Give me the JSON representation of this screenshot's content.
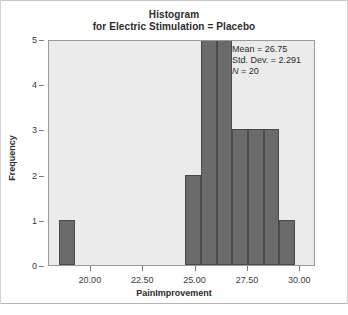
{
  "title": {
    "line1": "Histogram",
    "line2": "for Electric Stimulation = Placebo"
  },
  "stats": {
    "mean_label": "Mean = 26.75",
    "stddev_label": "Std. Dev. = 2.291",
    "n_symbol": "N",
    "n_value": " = 20"
  },
  "colors": {
    "bar_fill": "#6b6b6b",
    "bar_border": "#4a4a4a",
    "plot_background": "#ebebeb",
    "axis": "#9a9a9a",
    "text": "#2b2b2b"
  },
  "chart_data": {
    "type": "bar",
    "title": "Histogram for Electric Stimulation = Placebo",
    "xlabel": "PainImprovement",
    "ylabel": "Frequency",
    "xlim": [
      18.0,
      30.75
    ],
    "ylim": [
      0,
      5
    ],
    "grid": false,
    "legend": null,
    "bin_width": 0.75,
    "x_ticks": [
      {
        "value": 20.0,
        "label": "20.00"
      },
      {
        "value": 22.5,
        "label": "22.50"
      },
      {
        "value": 25.0,
        "label": "25.00"
      },
      {
        "value": 27.5,
        "label": "27.50"
      },
      {
        "value": 30.0,
        "label": "30.00"
      }
    ],
    "y_ticks": [
      {
        "value": 0,
        "label": "0"
      },
      {
        "value": 1,
        "label": "1"
      },
      {
        "value": 2,
        "label": "2"
      },
      {
        "value": 3,
        "label": "3"
      },
      {
        "value": 4,
        "label": "4"
      },
      {
        "value": 5,
        "label": "5"
      }
    ],
    "bars": [
      {
        "bin_start": 18.5,
        "bin_end": 19.25,
        "value": 1
      },
      {
        "bin_start": 24.5,
        "bin_end": 25.25,
        "value": 2
      },
      {
        "bin_start": 25.25,
        "bin_end": 26.0,
        "value": 5
      },
      {
        "bin_start": 26.0,
        "bin_end": 26.75,
        "value": 5
      },
      {
        "bin_start": 26.75,
        "bin_end": 27.5,
        "value": 3
      },
      {
        "bin_start": 27.5,
        "bin_end": 28.25,
        "value": 3
      },
      {
        "bin_start": 28.25,
        "bin_end": 29.0,
        "value": 3
      },
      {
        "bin_start": 29.0,
        "bin_end": 29.75,
        "value": 1
      }
    ],
    "annotations": [
      "Mean = 26.75",
      "Std. Dev. = 2.291",
      "N = 20"
    ]
  }
}
